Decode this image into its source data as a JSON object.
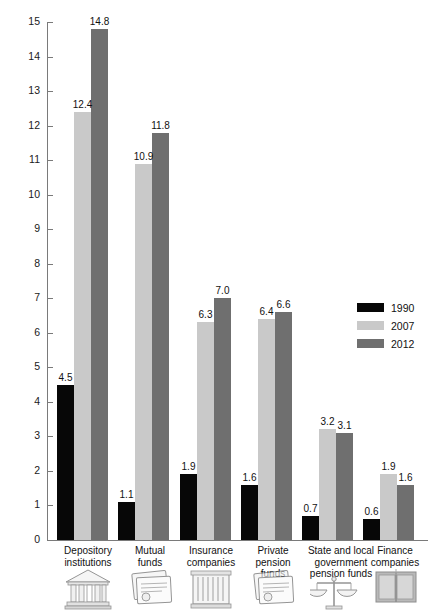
{
  "chart_data": {
    "type": "bar",
    "title": "",
    "subtitle": "",
    "xlabel": "",
    "ylabel": "",
    "ylim": [
      0,
      15
    ],
    "ytick_labels": [
      "0",
      "1",
      "2",
      "3",
      "4",
      "5",
      "6",
      "7",
      "8",
      "9",
      "10",
      "11",
      "12",
      "13",
      "14",
      "15"
    ],
    "ytick_values": [
      0,
      1,
      2,
      3,
      4,
      5,
      6,
      7,
      8,
      9,
      10,
      11,
      12,
      13,
      14,
      15
    ],
    "grid": false,
    "legend_position": "right",
    "categories": [
      "Depository institutions",
      "Mutual funds",
      "Insurance companies",
      "Private pension funds",
      "State and local government pension funds",
      "Finance companies"
    ],
    "category_lines": [
      [
        "Depository",
        "institutions"
      ],
      [
        "Mutual",
        "funds"
      ],
      [
        "Insurance",
        "companies"
      ],
      [
        "Private",
        "pension",
        "funds"
      ],
      [
        "State and local",
        "government",
        "pension funds"
      ],
      [
        "Finance",
        "companies"
      ]
    ],
    "category_icons": [
      "bank-building-icon",
      "documents-stack-icon",
      "office-building-icon",
      "documents-stack-icon",
      "scales-of-justice-icon",
      "open-book-icon"
    ],
    "series": [
      {
        "name": "1990",
        "color": "#070707",
        "values": [
          4.5,
          1.1,
          1.9,
          1.6,
          0.7,
          0.6
        ],
        "labels": [
          "4.5",
          "1.1",
          "1.9",
          "1.6",
          "0.7",
          "0.6"
        ]
      },
      {
        "name": "2007",
        "color": "#c9c9c9",
        "values": [
          12.4,
          10.9,
          6.3,
          6.4,
          3.2,
          1.9
        ],
        "labels": [
          "12.4",
          "10.9",
          "6.3",
          "6.4",
          "3.2",
          "1.9"
        ]
      },
      {
        "name": "2012",
        "color": "#6f6f6f",
        "values": [
          14.8,
          11.8,
          7.0,
          6.6,
          3.1,
          1.6
        ],
        "labels": [
          "14.8",
          "11.8",
          "7.0",
          "6.6",
          "3.1",
          "1.6"
        ]
      }
    ]
  },
  "legend": {
    "entries": [
      {
        "label": "1990",
        "color": "#070707"
      },
      {
        "label": "2007",
        "color": "#c9c9c9"
      },
      {
        "label": "2012",
        "color": "#6f6f6f"
      }
    ]
  },
  "axis": {
    "y_max_label": "15",
    "y_min_label": "0"
  }
}
